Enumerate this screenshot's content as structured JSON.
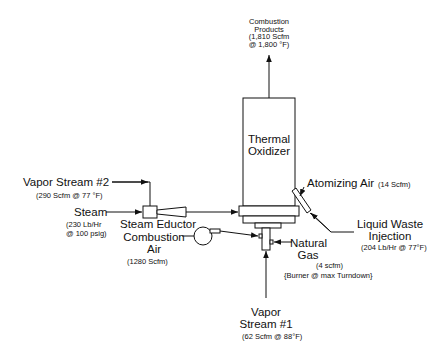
{
  "diagram": {
    "thermal_oxidizer": {
      "line1": "Thermal",
      "line2": "Oxidizer"
    },
    "combustion_products": {
      "line1": "Combustion",
      "line2": "Products",
      "line3": "(1,810 Scfm",
      "line4": "@ 1,800 °F)"
    },
    "vapor_stream_2": {
      "label": "Vapor Stream #2",
      "detail": "(290 Scfm @ 77 °F)"
    },
    "steam": {
      "label": "Steam",
      "detail1": "(230 Lb/Hr",
      "detail2": "@ 100 psig)"
    },
    "steam_eductor": {
      "label": "Steam Eductor"
    },
    "combustion_air": {
      "line1": "Combustion",
      "line2": "Air",
      "detail": "(1280 Scfm)"
    },
    "atomizing_air": {
      "label": "Atomizing Air",
      "detail": "(14 Scfm)"
    },
    "liquid_waste": {
      "line1": "Liquid Waste",
      "line2": "Injection",
      "detail": "(204 Lb/Hr @ 77°F)"
    },
    "natural_gas": {
      "line1": "Natural",
      "line2": "Gas",
      "detail1": "(4 scfm)",
      "detail2": "{Burner @ max Turndown}"
    },
    "vapor_stream_1": {
      "line1": "Vapor",
      "line2": "Stream #1",
      "detail": "(62 Scfm @ 88°F)"
    }
  }
}
